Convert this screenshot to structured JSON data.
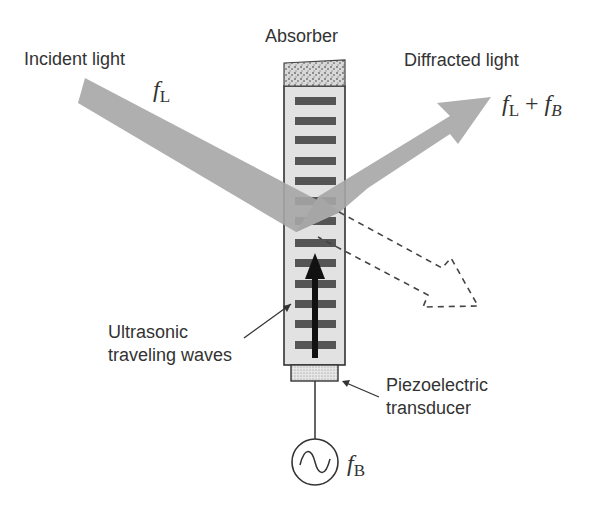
{
  "diagram": {
    "labels": {
      "absorber": "Absorber",
      "incident_light": "Incident light",
      "diffracted_light": "Diffracted light",
      "ultrasonic_line1": "Ultrasonic",
      "ultrasonic_line2": "traveling waves",
      "piezo_line1": "Piezoelectric",
      "piezo_line2": "transducer"
    },
    "math": {
      "incident_freq": {
        "base": "f",
        "sub": "L"
      },
      "diffracted_freq": {
        "base1": "f",
        "sub1": "L",
        "op": " + ",
        "base2": "f",
        "sub2": "B"
      },
      "source_freq": {
        "base": "f",
        "sub": "B"
      }
    },
    "components": [
      "absorber",
      "acousto-optic-crystal",
      "ultrasonic-wavefronts",
      "propagation-arrow",
      "piezoelectric-transducer",
      "rf-signal-source",
      "incident-beam",
      "diffracted-beam",
      "undiffracted-beam-dashed"
    ],
    "wavefront_count": 13,
    "colors": {
      "beam": "#a6a6a6",
      "crystal_fill": "#e2e2e2",
      "wavefront": "#555555",
      "outline": "#333333",
      "text": "#333333"
    }
  }
}
